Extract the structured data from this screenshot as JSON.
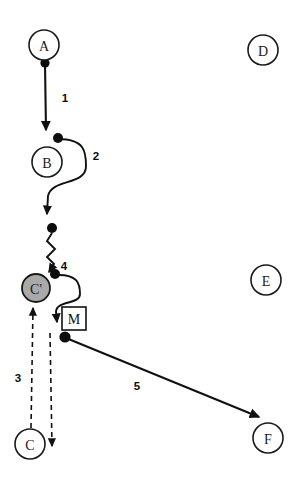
{
  "diagram": {
    "type": "node-link-diagram",
    "background_color": "#ffffff",
    "stroke_color": "#111111",
    "highlight_fill": "#a9a9a9",
    "nodes": [
      {
        "id": "A",
        "label": "A",
        "cx": 44,
        "cy": 45,
        "r": 15,
        "style": "outline"
      },
      {
        "id": "B",
        "label": "B",
        "cx": 47,
        "cy": 162,
        "r": 15,
        "style": "outline"
      },
      {
        "id": "Cp",
        "label": "C'",
        "cx": 36,
        "cy": 288,
        "r": 14,
        "style": "filled"
      },
      {
        "id": "C",
        "label": "C",
        "cx": 30,
        "cy": 444,
        "r": 15,
        "style": "outline"
      },
      {
        "id": "D",
        "label": "D",
        "cx": 263,
        "cy": 50,
        "r": 15,
        "style": "outline"
      },
      {
        "id": "E",
        "label": "E",
        "cx": 266,
        "cy": 280,
        "r": 15,
        "style": "outline"
      },
      {
        "id": "F",
        "label": "F",
        "cx": 268,
        "cy": 438,
        "r": 15,
        "style": "outline"
      }
    ],
    "markers": [
      {
        "id": "M",
        "label": "M",
        "x": 62,
        "y": 307,
        "w": 24,
        "h": 23
      }
    ],
    "edges": [
      {
        "id": "edge-1",
        "label": "1",
        "label_x": 65,
        "label_y": 98,
        "from": "A",
        "to": "B",
        "style": "solid-straight",
        "arrow": true,
        "path": "M 45 64 L 46 130",
        "start_dot": {
          "x": 45,
          "y": 63,
          "r": 4.6
        }
      },
      {
        "id": "edge-2",
        "label": "2",
        "label_x": 96,
        "label_y": 156,
        "from": "B",
        "to": "wave-start",
        "style": "solid-curved",
        "arrow": true,
        "path": "M 58 139 C 85 139 86 152 86 166 C 86 186 52 178 48 196 L 47 214",
        "start_dot": {
          "x": 58,
          "y": 138,
          "r": 5.0
        }
      },
      {
        "id": "edge-4",
        "label": "4",
        "label_x": 64,
        "label_y": 266,
        "from": "wave-start",
        "to": "Cp",
        "style": "zigzag",
        "arrow": true,
        "path": "M 52 233 L 47 241 L 55 249 L 47 257 L 54 264 L 49 272",
        "start_dot": {
          "x": 52,
          "y": 228,
          "r": 5.0
        }
      },
      {
        "id": "edge-4b",
        "label": "",
        "from": "Cp",
        "to": "M",
        "style": "solid-curved",
        "arrow": true,
        "path": "M 56 275 C 78 274 80 284 80 294 C 80 305 56 300 56 312 L 57 322",
        "start_dot": {
          "x": 55,
          "y": 274,
          "r": 5.0
        }
      },
      {
        "id": "edge-3-up",
        "label": "3",
        "label_x": 18,
        "label_y": 378,
        "from": "C",
        "to": "Cp",
        "style": "dashed",
        "arrow": true,
        "path": "M 31 428 L 33 308"
      },
      {
        "id": "edge-3-down",
        "label": "",
        "from": "M",
        "to": "below-C",
        "style": "dashed",
        "arrow": true,
        "path": "M 50 333 L 52 446"
      },
      {
        "id": "edge-5",
        "label": "5",
        "label_x": 137,
        "label_y": 386,
        "from": "M",
        "to": "F",
        "style": "solid-straight",
        "arrow": true,
        "path": "M 66 338 L 259 417",
        "start_dot": {
          "x": 65,
          "y": 337,
          "r": 5.6
        }
      }
    ]
  }
}
